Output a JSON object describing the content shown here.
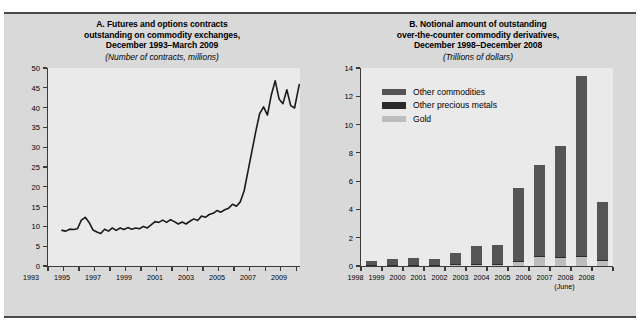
{
  "figure": {
    "background": "#ffffff",
    "panel_background": "#d9d9d9",
    "plot_background": "#eaeaea",
    "rule_color": "#4a4a4a"
  },
  "panel_a": {
    "title_line1": "A. Futures and options contracts",
    "title_line2": "outstanding on commodity  exchanges,",
    "title_line3": "December 1993–March 2009",
    "subtitle": "(Number of contracts, millions)"
  },
  "panel_b": {
    "title_line1": "B. Notional amount of outstanding",
    "title_line2": "over-the-counter commodity derivatives,",
    "title_line3": "December 1998–December 2008",
    "subtitle": "(Trillions of dollars)",
    "legend": [
      {
        "label": "Other commodities",
        "color": "#555555"
      },
      {
        "label": "Other precious metals",
        "color": "#2b2b2b"
      },
      {
        "label": "Gold",
        "color": "#bdbdbd"
      }
    ]
  },
  "chart_data": [
    {
      "type": "line",
      "id": "panel-a",
      "title": "A. Futures and options contracts outstanding on commodity  exchanges, December 1993–March 2009",
      "subtitle": "(Number of contracts, millions)",
      "xlabel": "",
      "ylabel": "",
      "ylim": [
        0,
        50
      ],
      "yticks": [
        0,
        5,
        10,
        15,
        20,
        25,
        30,
        35,
        40,
        45,
        50
      ],
      "xlim": [
        1993,
        2009.25
      ],
      "xticks": [
        1993,
        1994,
        1995,
        1996,
        1997,
        1998,
        1999,
        2000,
        2001,
        2002,
        2003,
        2004,
        2005,
        2006,
        2007,
        2008,
        2009
      ],
      "xticklabels": [
        "1993",
        "",
        "1995",
        "",
        "1997",
        "",
        "1999",
        "",
        "2001",
        "",
        "2003",
        "",
        "2005",
        "",
        "2007",
        "",
        "2009"
      ],
      "grid": false,
      "legend_position": "none",
      "line_color": "#1a1a1a",
      "series": [
        {
          "name": "Futures and options contracts outstanding",
          "x": [
            1993.9,
            1994.15,
            1994.4,
            1994.65,
            1994.9,
            1995.15,
            1995.4,
            1995.65,
            1995.9,
            1996.15,
            1996.4,
            1996.65,
            1996.9,
            1997.15,
            1997.4,
            1997.65,
            1997.9,
            1998.15,
            1998.4,
            1998.65,
            1998.9,
            1999.15,
            1999.4,
            1999.65,
            1999.9,
            2000.15,
            2000.4,
            2000.65,
            2000.9,
            2001.15,
            2001.4,
            2001.65,
            2001.9,
            2002.15,
            2002.4,
            2002.65,
            2002.9,
            2003.15,
            2003.4,
            2003.65,
            2003.9,
            2004.15,
            2004.4,
            2004.65,
            2004.9,
            2005.15,
            2005.4,
            2005.65,
            2005.9,
            2006.15,
            2006.4,
            2006.65,
            2006.9,
            2007.15,
            2007.4,
            2007.65,
            2007.9,
            2008.15,
            2008.4,
            2008.65,
            2008.9,
            2009.2
          ],
          "y": [
            9.0,
            8.8,
            9.3,
            9.2,
            9.4,
            11.6,
            12.3,
            11.0,
            9.1,
            8.6,
            8.2,
            9.3,
            8.8,
            9.6,
            9.0,
            9.6,
            9.2,
            9.7,
            9.3,
            9.6,
            9.4,
            10.0,
            9.6,
            10.4,
            11.2,
            11.0,
            11.6,
            11.0,
            11.7,
            11.2,
            10.6,
            11.1,
            10.6,
            11.3,
            11.9,
            11.5,
            12.6,
            12.3,
            13.0,
            13.3,
            14.0,
            13.6,
            14.2,
            14.6,
            15.6,
            15.1,
            16.2,
            19.0,
            24.0,
            29.0,
            34.0,
            38.5,
            40.2,
            38.1,
            43.2,
            46.8,
            42.2,
            41.0,
            44.5,
            40.5,
            39.9,
            45.8
          ]
        }
      ]
    },
    {
      "type": "bar",
      "id": "panel-b",
      "stacked": true,
      "title": "B. Notional amount of outstanding over-the-counter commodity derivatives, December 1998–December 2008",
      "subtitle": "(Trillions of dollars)",
      "xlabel": "",
      "ylabel": "",
      "ylim": [
        0,
        14
      ],
      "yticks": [
        0,
        2,
        4,
        6,
        8,
        10,
        12,
        14
      ],
      "categories": [
        "1998",
        "1999",
        "2000",
        "2001",
        "2002",
        "2003",
        "2004",
        "2005",
        "2006",
        "2007",
        "2008",
        "2008"
      ],
      "category_sublabels": [
        "",
        "",
        "",
        "",
        "",
        "",
        "",
        "",
        "",
        "",
        "(June)",
        ""
      ],
      "grid": false,
      "legend_position": "upper left",
      "series": [
        {
          "name": "Gold",
          "color": "#bdbdbd",
          "values": [
            0.06,
            0.07,
            0.08,
            0.07,
            0.1,
            0.12,
            0.14,
            0.3,
            0.64,
            0.58,
            0.65,
            0.4
          ]
        },
        {
          "name": "Other precious metals",
          "color": "#2b2b2b",
          "values": [
            0.02,
            0.02,
            0.02,
            0.02,
            0.03,
            0.03,
            0.03,
            0.04,
            0.05,
            0.05,
            0.05,
            0.04
          ]
        },
        {
          "name": "Other commodities",
          "color": "#555555",
          "values": [
            0.3,
            0.41,
            0.48,
            0.41,
            0.8,
            1.25,
            1.28,
            5.16,
            6.45,
            7.85,
            12.7,
            4.06
          ]
        }
      ],
      "totals": [
        0.38,
        0.5,
        0.58,
        0.5,
        0.93,
        1.4,
        1.45,
        5.5,
        7.14,
        8.48,
        13.4,
        4.5
      ]
    }
  ]
}
